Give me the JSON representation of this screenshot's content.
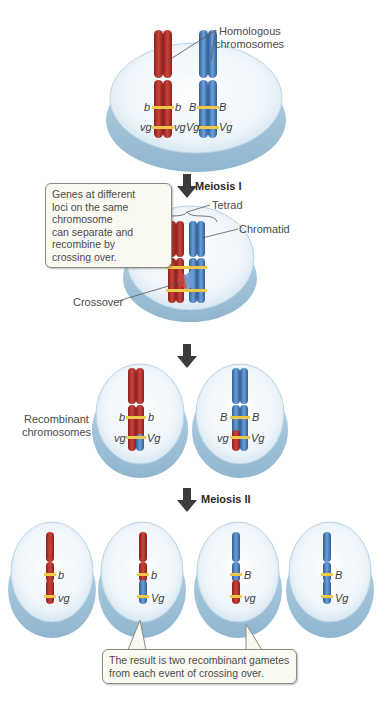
{
  "colors": {
    "maternal_red": "#b8322c",
    "paternal_blue": "#4f86c6",
    "gene_band_yellow": "#f2c84a",
    "cell_fill": "#e8f2f8",
    "cell_rim": "#a9c9dd",
    "arrow": "#3b3b3b"
  },
  "stage1": {
    "label_homologous": [
      "Homologous",
      "chromosomes"
    ],
    "genes": {
      "red_left_b": "b",
      "red_right_b": "b",
      "red_left_vg": "vg",
      "red_right_vg": "vg",
      "blue_left_B": "B",
      "blue_right_B": "B",
      "blue_left_Vg": "Vg",
      "blue_right_Vg": "Vg"
    }
  },
  "step1": {
    "label": "Meiosis I"
  },
  "stage2": {
    "label_tetrad": "Tetrad",
    "label_chromatid": "Chromatid",
    "label_crossover": "Crossover",
    "callout_lines": [
      "Genes at different",
      "loci on the same",
      "chromosome",
      "can separate and",
      "recombine by",
      "crossing over."
    ]
  },
  "stage3": {
    "label_recombinant": [
      "Recombinant",
      "chromosomes"
    ],
    "left_cell_genes": {
      "b_left": "b",
      "b_right": "b",
      "vg_left": "vg",
      "Vg_right": "Vg"
    },
    "right_cell_genes": {
      "B_left": "B",
      "B_right": "B",
      "vg_left": "vg",
      "Vg_right": "Vg"
    }
  },
  "step2": {
    "label": "Meiosis II"
  },
  "stage4": {
    "gametes": [
      {
        "top_gene": "b",
        "bottom_gene": "vg",
        "top_color": "red",
        "bottom_color": "red"
      },
      {
        "top_gene": "b",
        "bottom_gene": "Vg",
        "top_color": "red",
        "bottom_color": "blue"
      },
      {
        "top_gene": "B",
        "bottom_gene": "vg",
        "top_color": "blue",
        "bottom_color": "red"
      },
      {
        "top_gene": "B",
        "bottom_gene": "Vg",
        "top_color": "blue",
        "bottom_color": "blue"
      }
    ],
    "callout_lines": [
      "The result is two recombinant gametes",
      "from each event of crossing over."
    ]
  }
}
